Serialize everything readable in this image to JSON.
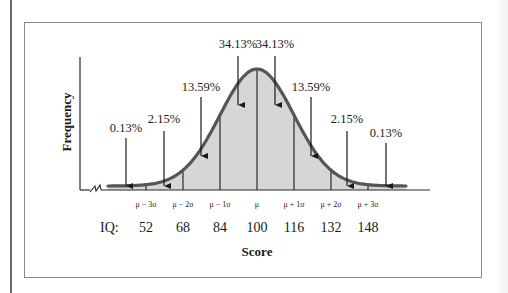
{
  "chart_data": {
    "type": "area",
    "title": "",
    "xlabel": "Score",
    "ylabel": "Frequency",
    "sigma_labels": [
      "μ − 3σ",
      "μ − 2σ",
      "μ − 1σ",
      "μ",
      "μ + 1σ",
      "μ + 2σ",
      "μ + 3σ"
    ],
    "iq_prefix": "IQ:",
    "iq_values": [
      52,
      68,
      84,
      100,
      116,
      132,
      148
    ],
    "mean": 100,
    "sd": 16,
    "bands": [
      {
        "range": "below μ − 3σ",
        "percent": 0.13,
        "label": "0.13%"
      },
      {
        "range": "μ − 3σ to μ − 2σ",
        "percent": 2.15,
        "label": "2.15%"
      },
      {
        "range": "μ − 2σ to μ − 1σ",
        "percent": 13.59,
        "label": "13.59%"
      },
      {
        "range": "μ − 1σ to μ",
        "percent": 34.13,
        "label": "34.13%"
      },
      {
        "range": "μ to μ + 1σ",
        "percent": 34.13,
        "label": "34.13%"
      },
      {
        "range": "μ + 1σ to μ + 2σ",
        "percent": 13.59,
        "label": "13.59%"
      },
      {
        "range": "μ + 2σ to μ + 3σ",
        "percent": 2.15,
        "label": "2.15%"
      },
      {
        "range": "above μ + 3σ",
        "percent": 0.13,
        "label": "0.13%"
      }
    ],
    "grid": false,
    "legend": "none",
    "colors": {
      "curve": "#555555",
      "fill": "#d6d6d6",
      "lines": "#1a1a1a"
    }
  }
}
